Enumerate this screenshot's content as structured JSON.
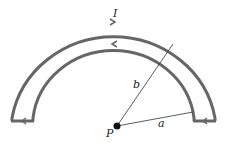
{
  "diagram": {
    "labels": {
      "current": "I",
      "outer_radius": "b",
      "inner_radius": "a",
      "point": "P"
    },
    "geometry": {
      "center": [
        117,
        126
      ],
      "outer_radius_px": 102,
      "inner_radius_px": 81,
      "shape": "semicircular loop with inner and outer arcs joined by radial segments"
    },
    "current_direction": {
      "outer_arc": "clockwise (left to right over top)",
      "inner_arc": "counterclockwise (right to left over top)",
      "bottom_segments": "leftward"
    },
    "colors": {
      "loop": "#666666",
      "line": "#333333",
      "point": "#111111",
      "background": "#ffffff"
    }
  }
}
